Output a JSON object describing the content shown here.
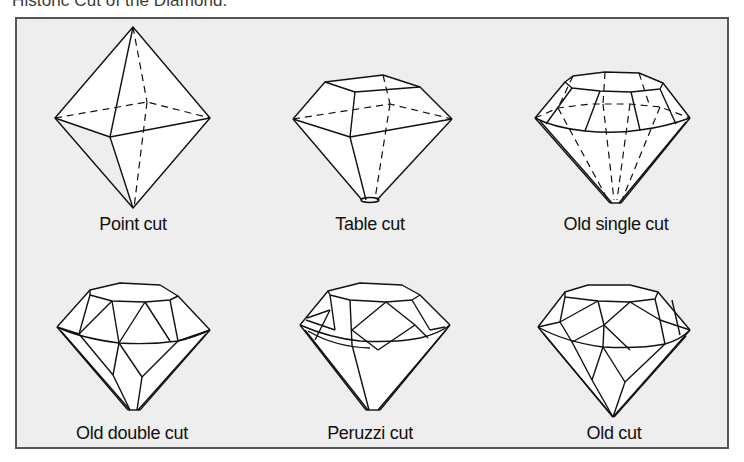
{
  "title": "Historic Cut of the Diamond.",
  "colors": {
    "panel_background": "#eeeeee",
    "panel_border": "#555555",
    "line": "#111111",
    "facet_fill": "#ffffff"
  },
  "cuts": [
    {
      "id": "point",
      "label": "Point cut"
    },
    {
      "id": "table",
      "label": "Table cut"
    },
    {
      "id": "old-single",
      "label": "Old single cut"
    },
    {
      "id": "old-double",
      "label": "Old double cut"
    },
    {
      "id": "peruzzi",
      "label": "Peruzzi cut"
    },
    {
      "id": "old",
      "label": "Old cut"
    }
  ]
}
